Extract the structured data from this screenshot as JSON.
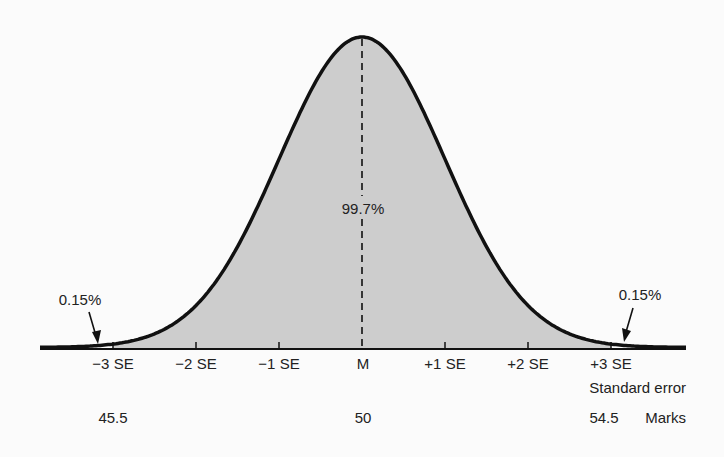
{
  "chart_data": {
    "type": "area",
    "title": "",
    "xlabel": "Standard error",
    "secondary_xlabel": "Marks",
    "ylabel": "",
    "x_ticks": [
      "-3 SE",
      "-2 SE",
      "-1 SE",
      "M",
      "+1 SE",
      "+2 SE",
      "+3 SE"
    ],
    "x_tick_values_se": [
      -3,
      -2,
      -1,
      0,
      1,
      2,
      3
    ],
    "marks": [
      {
        "se": -3,
        "label": "45.5"
      },
      {
        "se": 0,
        "label": "50"
      },
      {
        "se": 3,
        "label": "54.5"
      }
    ],
    "distribution": {
      "mean": 50,
      "standard_error": 1.5,
      "shape": "normal"
    },
    "shaded_region": {
      "from_se": -3,
      "to_se": 3,
      "label": "99.7%"
    },
    "tail_annotations": [
      {
        "side": "left",
        "label": "0.15%"
      },
      {
        "side": "right",
        "label": "0.15%"
      }
    ],
    "mean_line": "dashed",
    "grid": false,
    "legend": null
  },
  "labels": {
    "center_pct": "99.7%",
    "left_tail": "0.15%",
    "right_tail": "0.15%",
    "axis_title": "Standard error",
    "marks_title": "Marks",
    "ticks": [
      "−3 SE",
      "−2 SE",
      "−1 SE",
      "M",
      "+1 SE",
      "+2 SE",
      "+3 SE"
    ],
    "mark_low": "45.5",
    "mark_mid": "50",
    "mark_high": "54.5"
  },
  "colors": {
    "fill": "#cdcdcd",
    "curve": "#111111",
    "background": "#fbfbfb"
  }
}
